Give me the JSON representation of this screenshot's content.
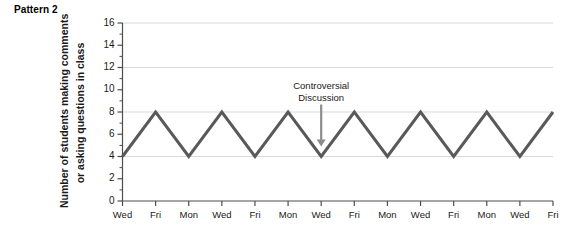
{
  "panel": {
    "title": "Pattern 2"
  },
  "chart_data": {
    "type": "line",
    "title": "Pattern 2",
    "xlabel": "",
    "ylabel": "Number of students making comments or asking questions in class",
    "ylabel_line1": "Number of students making comments",
    "ylabel_line2": "or asking questions in class",
    "categories": [
      "Wed",
      "Fri",
      "Mon",
      "Wed",
      "Fri",
      "Mon",
      "Wed",
      "Fri",
      "Mon",
      "Wed",
      "Fri",
      "Mon",
      "Wed",
      "Fri"
    ],
    "values": [
      4,
      8,
      4,
      8,
      4,
      8,
      4,
      8,
      4,
      8,
      4,
      8,
      4,
      8
    ],
    "ylim": [
      0,
      16
    ],
    "yticks": [
      0,
      2,
      4,
      6,
      8,
      10,
      12,
      14,
      16
    ],
    "ytick_labels": [
      "0",
      "2",
      "4",
      "6",
      "8",
      "10",
      "12",
      "14",
      "16"
    ],
    "gridlines": [
      4,
      8,
      12,
      16
    ],
    "grid": true,
    "legend": false,
    "line_color": "#595959",
    "grid_color": "#d9d9d9",
    "axis_color": "#4d4d4d",
    "annotations": [
      {
        "text_line1": "Controversial",
        "text_line2": "Discussion",
        "target_category_index": 6,
        "target_value": 4,
        "arrow_color": "#8c8c8c"
      }
    ]
  }
}
